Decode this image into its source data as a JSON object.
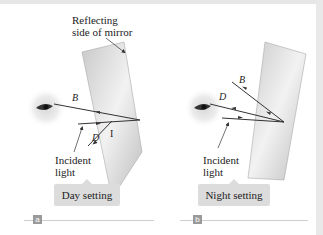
{
  "panels": [
    {
      "id": "a",
      "caption_tag": "a",
      "setting_label": "Day setting",
      "incident_label_line1": "Incident",
      "incident_label_line2": "light",
      "ray_labels": {
        "B": "B",
        "D": "D",
        "I": "I"
      },
      "mirror_label_line1": "Reflecting",
      "mirror_label_line2": "side of mirror"
    },
    {
      "id": "b",
      "caption_tag": "b",
      "setting_label": "Night setting",
      "incident_label_line1": "Incident",
      "incident_label_line2": "light",
      "ray_labels": {
        "B": "B",
        "D": "D"
      }
    }
  ]
}
